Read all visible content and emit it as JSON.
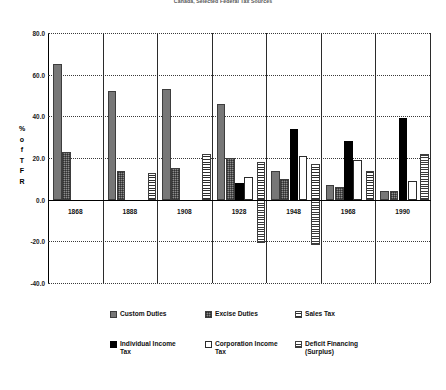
{
  "chart_data": {
    "type": "bar",
    "title": "Canada, Selected Federal Tax Sources",
    "xlabel": "",
    "ylabel": "% of TFR",
    "ylabel_chars": [
      "%",
      "o",
      "f",
      "T",
      "F",
      "R"
    ],
    "categories": [
      "1868",
      "1888",
      "1908",
      "1928",
      "1948",
      "1968",
      "1990"
    ],
    "ylim": [
      -40.0,
      80.0
    ],
    "yticks": [
      80.0,
      60.0,
      40.0,
      20.0,
      0.0,
      -20.0,
      -40.0
    ],
    "ytick_labels": [
      "80.0",
      "60.0",
      "40.0",
      "20.0",
      "0.0",
      "-20.0",
      "-40.0"
    ],
    "grid": true,
    "legend_position": "bottom",
    "series": [
      {
        "name": "Custom Duties",
        "key": "custom",
        "swatch": "grey-solid",
        "values": [
          65,
          52,
          53,
          46,
          14,
          7,
          4
        ]
      },
      {
        "name": "Excise Duties",
        "key": "excise",
        "swatch": "grey-crosshatch",
        "values": [
          23,
          14,
          15,
          20,
          10,
          6,
          4
        ]
      },
      {
        "name": "Sales Tax",
        "key": "sales",
        "swatch": "horizontal-lines",
        "values": [
          null,
          null,
          13,
          22,
          18,
          17,
          14
        ]
      },
      {
        "name": "Individual Income Tax",
        "key": "indiv",
        "swatch": "black-solid",
        "values": [
          null,
          null,
          null,
          8,
          34,
          28,
          39
        ]
      },
      {
        "name": "Corporation Income Tax",
        "key": "corp",
        "swatch": "white-open",
        "values": [
          null,
          null,
          null,
          11,
          21,
          19,
          9
        ]
      },
      {
        "name": "Deficit Financing (Surplus)",
        "key": "deficit",
        "swatch": "horizontal-lines",
        "values": [
          null,
          null,
          null,
          -21,
          -22,
          8,
          22
        ]
      }
    ]
  },
  "colors": {
    "custom": "#777777",
    "excise": "#8d8d8d",
    "sales": "#d8d8d8",
    "indiv": "#000000",
    "corp": "#ffffff",
    "deficit": "#cfcfcf",
    "axis": "#000000",
    "grid": "#3a3a3a"
  },
  "legend": {
    "row1": [
      "Custom Duties",
      "Excise Duties",
      "Sales Tax"
    ],
    "row2": [
      "Individual Income Tax",
      "Corporation Income Tax",
      "Deficit Financing (Surplus)"
    ],
    "items": [
      {
        "label_line1": "Custom Duties",
        "label_line2": ""
      },
      {
        "label_line1": "Excise Duties",
        "label_line2": ""
      },
      {
        "label_line1": "Sales Tax",
        "label_line2": ""
      },
      {
        "label_line1": "Individual Income",
        "label_line2": "Tax"
      },
      {
        "label_line1": "Corporation Income",
        "label_line2": "Tax"
      },
      {
        "label_line1": "Deficit Financing",
        "label_line2": "(Surplus)"
      }
    ]
  }
}
